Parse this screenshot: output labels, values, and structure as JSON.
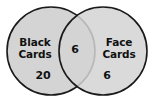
{
  "diagram": {
    "type": "venn",
    "background_color": "#ffffff",
    "circle_fill_color": "#d4d4d4",
    "circle_stroke_color": "#1a1a1a",
    "text_color": "#111111",
    "sets": [
      {
        "id": "left",
        "label_line1": "Black",
        "label_line2": "Cards",
        "exclusive_count": "20"
      },
      {
        "id": "right",
        "label_line1": "Face",
        "label_line2": "Cards",
        "exclusive_count": "6"
      }
    ],
    "intersection": {
      "count": "6"
    }
  }
}
